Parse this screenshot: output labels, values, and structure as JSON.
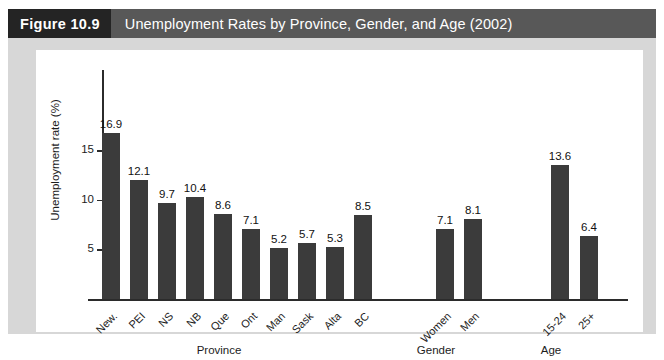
{
  "header": {
    "figure_number": "Figure 10.9",
    "title": "Unemployment Rates by Province, Gender, and Age (2002)"
  },
  "colors": {
    "title_bar": "#585858",
    "figure_number_bg": "#242424",
    "frame": "#d7d7d7",
    "panel": "#ffffff",
    "bar": "#3b3b3b",
    "axis": "#2b2b2b"
  },
  "chart_data": {
    "type": "bar",
    "title": "Unemployment Rates by Province, Gender, and Age (2002)",
    "xlabel": "",
    "ylabel": "Unemployment rate (%)",
    "ylim": [
      0,
      18
    ],
    "yticks": [
      5,
      10,
      15
    ],
    "ytick_labels": [
      "5",
      "10",
      "15"
    ],
    "grid": false,
    "legend": null,
    "categories": [
      "New.",
      "PEI",
      "NS",
      "NB",
      "Que",
      "Ont",
      "Man",
      "Sask",
      "Alta",
      "BC",
      "Women",
      "Men",
      "15-24",
      "25+"
    ],
    "values": [
      16.9,
      12.1,
      9.7,
      10.4,
      8.6,
      7.1,
      5.2,
      5.7,
      5.3,
      8.5,
      7.1,
      8.1,
      13.6,
      6.4
    ],
    "data_labels": [
      "16.9",
      "12.1",
      "9.7",
      "10.4",
      "8.6",
      "7.1",
      "5.2",
      "5.7",
      "5.3",
      "8.5",
      "7.1",
      "8.1",
      "13.6",
      "6.4"
    ],
    "groups": [
      {
        "label": "Province",
        "categories": [
          "New.",
          "PEI",
          "NS",
          "NB",
          "Que",
          "Ont",
          "Man",
          "Sask",
          "Alta",
          "BC"
        ]
      },
      {
        "label": "Gender",
        "categories": [
          "Women",
          "Men"
        ]
      },
      {
        "label": "Age",
        "categories": [
          "15-24",
          "25+"
        ]
      }
    ],
    "group_labels": [
      "Province",
      "Gender",
      "Age"
    ]
  }
}
